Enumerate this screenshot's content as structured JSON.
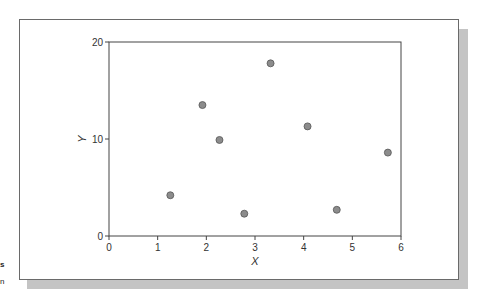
{
  "chart_data": {
    "type": "scatter",
    "title": "",
    "xlabel": "X",
    "ylabel": "Y",
    "xlim": [
      0,
      6
    ],
    "ylim": [
      0,
      20
    ],
    "xticks": [
      0,
      1,
      2,
      3,
      4,
      5,
      6
    ],
    "yticks": [
      0,
      10,
      20
    ],
    "grid": false,
    "legend": null,
    "points": [
      {
        "x": 1.26,
        "y": 4.2
      },
      {
        "x": 1.92,
        "y": 13.5
      },
      {
        "x": 2.27,
        "y": 9.9
      },
      {
        "x": 2.78,
        "y": 2.3
      },
      {
        "x": 3.32,
        "y": 17.8
      },
      {
        "x": 4.08,
        "y": 11.3
      },
      {
        "x": 4.68,
        "y": 2.7
      },
      {
        "x": 5.73,
        "y": 8.6
      }
    ],
    "marker": {
      "fill": "#8c8c8c",
      "stroke": "#555555",
      "radius": 3.5
    }
  },
  "colors": {
    "axis": "#444444",
    "frame_border": "#6a6a6a",
    "shadow": "#c4c4c4"
  },
  "edge_fragments": [
    "s",
    "n"
  ]
}
